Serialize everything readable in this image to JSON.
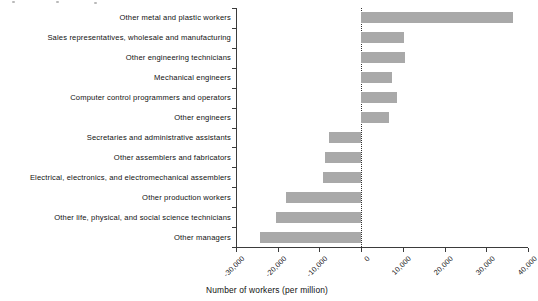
{
  "chart_data": {
    "type": "bar",
    "orientation": "horizontal",
    "title": "",
    "xlabel": "Number of workers (per million)",
    "ylabel": "",
    "xlim": [
      -30000,
      40000
    ],
    "xticks": [
      -30000,
      -20000,
      -10000,
      0,
      10000,
      20000,
      30000,
      40000
    ],
    "xticklabels": [
      "-30,000",
      "-20,000",
      "-10,000",
      "0",
      "10,000",
      "20,000",
      "30,000",
      "40,000"
    ],
    "grid": false,
    "legend": false,
    "zero_reference_line": true,
    "bar_color": "#a9a9a9",
    "axis_color": "#3b3b3b",
    "categories": [
      "Other metal and plastic workers",
      "Sales representatives, wholesale and manufacturing",
      "Other engineering technicians",
      "Mechanical engineers",
      "Computer control programmers and operators",
      "Other engineers",
      "Secretaries and administrative assistants",
      "Other assemblers and fabricators",
      "Electrical, electronics, and electromechanical assemblers",
      "Other production workers",
      "Other life, physical, and social science technicians",
      "Other managers"
    ],
    "values": [
      36500,
      10300,
      10500,
      7500,
      8600,
      6700,
      -7600,
      -8600,
      -9200,
      -18100,
      -20500,
      -24300
    ]
  }
}
